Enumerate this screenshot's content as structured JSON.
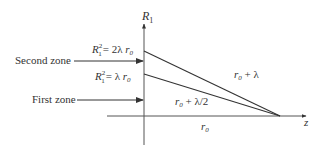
{
  "diagram": {
    "axes": {
      "vertical_label": "R",
      "vertical_label_sub": "1",
      "horizontal_label": "z"
    },
    "zones": {
      "second": {
        "label": "Second zone",
        "formula_base": "R",
        "formula_sub": "1",
        "formula_sup": "2",
        "formula_rhs": "= 2λ ",
        "formula_var": "r",
        "formula_var_sub": "0"
      },
      "first": {
        "label": "First zone",
        "formula_base": "R",
        "formula_sub": "1",
        "formula_sup": "2",
        "formula_rhs": "= λ ",
        "formula_var": "r",
        "formula_var_sub": "0"
      }
    },
    "paths": {
      "upper": {
        "var": "r",
        "sub": "0",
        "rest": " + λ"
      },
      "lower": {
        "var": "r",
        "sub": "0",
        "rest": " + λ/2"
      },
      "axis": {
        "var": "r",
        "sub": "0"
      }
    },
    "colors": {
      "line": "#333333",
      "text": "#333333"
    }
  }
}
